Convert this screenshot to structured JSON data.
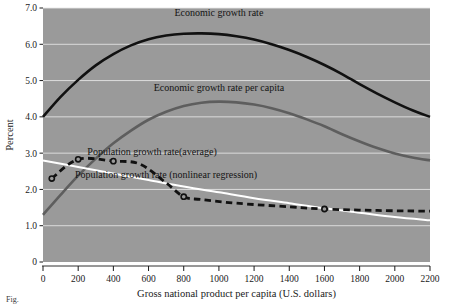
{
  "figure": {
    "caption_fragment": "Fig."
  },
  "chart_data": {
    "type": "line",
    "title": "",
    "xlabel": "Gross national product per capita (U.S. dollars)",
    "ylabel": "Percent",
    "xlim": [
      0,
      2200
    ],
    "ylim": [
      0,
      7.0
    ],
    "xticks": [
      0,
      200,
      400,
      600,
      800,
      1000,
      1200,
      1400,
      1600,
      1800,
      2000,
      2200
    ],
    "xticklabels": [
      "0",
      "200",
      "400",
      "600",
      "800",
      "1000",
      "1200",
      "1400",
      "1600",
      "1800",
      "2000",
      "2200"
    ],
    "yticks": [
      0,
      1.0,
      2.0,
      3.0,
      4.0,
      5.0,
      6.0,
      7.0
    ],
    "yticklabels": [
      "0",
      "1.0",
      "2.0",
      "3.0",
      "4.0",
      "5.0",
      "6.0",
      "7.0"
    ],
    "grid": "horizontal-white",
    "plot_background": "#9a9a9a",
    "legend": "inline-annotations",
    "series": [
      {
        "name": "Economic growth rate",
        "style": "solid",
        "color": "#111111",
        "width": 2.6,
        "label_x": 1000,
        "label_y": 6.78,
        "x": [
          0,
          100,
          200,
          300,
          400,
          500,
          600,
          700,
          800,
          900,
          1000,
          1100,
          1200,
          1300,
          1400,
          1500,
          1600,
          1700,
          1800,
          1900,
          2000,
          2100,
          2200
        ],
        "y": [
          4.0,
          4.55,
          5.02,
          5.42,
          5.73,
          5.97,
          6.14,
          6.24,
          6.29,
          6.3,
          6.28,
          6.22,
          6.13,
          6.0,
          5.84,
          5.65,
          5.43,
          5.18,
          4.9,
          4.64,
          4.4,
          4.18,
          4.0
        ]
      },
      {
        "name": "Economic growth rate  per capita",
        "style": "solid",
        "color": "#5e5e5e",
        "width": 2.6,
        "label_x": 1000,
        "label_y": 4.72,
        "x": [
          0,
          100,
          200,
          300,
          400,
          500,
          600,
          700,
          800,
          900,
          1000,
          1100,
          1200,
          1300,
          1400,
          1500,
          1600,
          1700,
          1800,
          1900,
          2000,
          2100,
          2200
        ],
        "y": [
          1.3,
          1.85,
          2.38,
          2.85,
          3.27,
          3.62,
          3.92,
          4.14,
          4.3,
          4.39,
          4.42,
          4.4,
          4.34,
          4.24,
          4.1,
          3.93,
          3.74,
          3.52,
          3.32,
          3.14,
          2.99,
          2.88,
          2.8
        ]
      },
      {
        "name": "Population growth rate(average)",
        "style": "solid",
        "color": "#ffffff",
        "width": 2.0,
        "label_x": 620,
        "label_y": 2.96,
        "x": [
          0,
          200,
          400,
          600,
          800,
          1000,
          1200,
          1400,
          1600,
          1800,
          2000,
          2200
        ],
        "y": [
          2.8,
          2.62,
          2.44,
          2.26,
          2.08,
          1.92,
          1.76,
          1.62,
          1.48,
          1.36,
          1.24,
          1.15
        ]
      },
      {
        "name": "Population growth rate (nonlinear regression)",
        "style": "dashed",
        "color": "#111111",
        "width": 2.8,
        "markers": true,
        "label_x": 700,
        "label_y": 2.32,
        "x": [
          50,
          200,
          400,
          550,
          700,
          800,
          900,
          1100,
          1400,
          1600,
          1900,
          2200
        ],
        "y": [
          2.3,
          2.83,
          2.78,
          2.7,
          2.18,
          1.8,
          1.72,
          1.62,
          1.52,
          1.46,
          1.42,
          1.4
        ],
        "marker_x": [
          50,
          200,
          400,
          800,
          1600
        ],
        "marker_y": [
          2.3,
          2.83,
          2.78,
          1.8,
          1.46
        ]
      }
    ]
  }
}
